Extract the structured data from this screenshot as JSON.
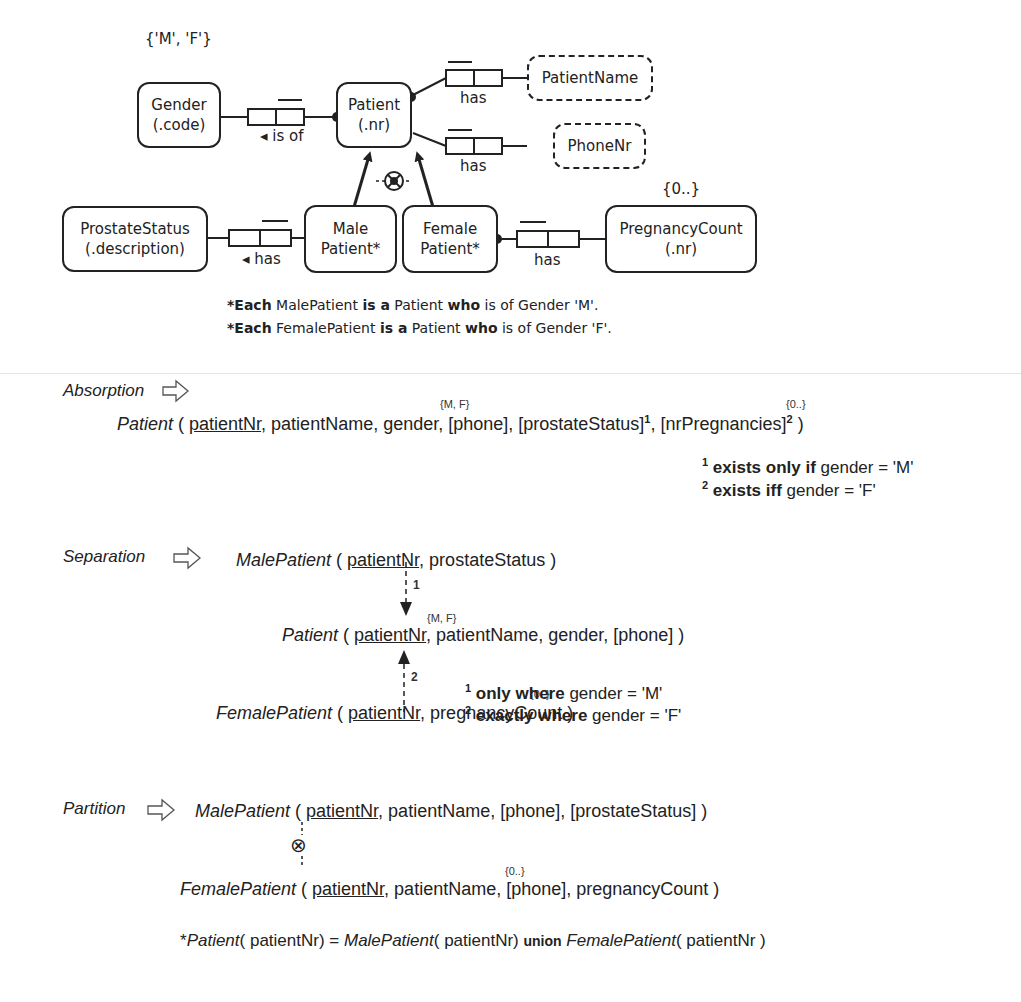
{
  "orm_diagram": {
    "entities": {
      "gender": {
        "name": "Gender",
        "ref": "(.code)",
        "value_constraint": "{'M', 'F'}"
      },
      "patient": {
        "name": "Patient",
        "ref": "(.nr)"
      },
      "patient_name": {
        "name": "PatientName"
      },
      "phone_nr": {
        "name": "PhoneNr"
      },
      "prostate_status": {
        "name": "ProstateStatus",
        "ref": "(.description)"
      },
      "male_patient": {
        "name": "Male",
        "name2": "Patient*"
      },
      "female_patient": {
        "name": "Female",
        "name2": "Patient*"
      },
      "pregnancy_count": {
        "name": "PregnancyCount",
        "ref": "(.nr)",
        "value_constraint": "{0..}"
      }
    },
    "fact_types": {
      "gender_patient": "◂ is of",
      "patient_name": "has",
      "patient_phone": "has",
      "male_prostate": "◂ has",
      "female_pregnancy": "has"
    },
    "subtype_definitions": [
      {
        "star": "*",
        "each": "Each",
        "subtype": " MalePatient ",
        "is_a": "is a",
        "super": " Patient ",
        "who": "who",
        "rest": " is of Gender 'M'."
      },
      {
        "star": "*",
        "each": "Each",
        "subtype": " FemalePatient ",
        "is_a": "is a",
        "super": " Patient ",
        "who": "who",
        "rest": " is of Gender 'F'."
      }
    ]
  },
  "absorption": {
    "label": "Absorption",
    "relation_name": "Patient",
    "open": " ( ",
    "key": "patientNr",
    "rest_a": ", patientName, gender, [phone], [prostateStatus]",
    "sup1": "1",
    "rest_b": ", [nrPregnancies]",
    "sup2": "2",
    "close": " )",
    "gender_constraint": "{M, F}",
    "count_constraint": "{0..}",
    "footnotes": [
      {
        "num": "1",
        "bold": " exists only if",
        "text": " gender = 'M'"
      },
      {
        "num": "2",
        "bold": " exists iff",
        "text": " gender = 'F'"
      }
    ]
  },
  "separation": {
    "label": "Separation",
    "male": {
      "name": "MalePatient",
      "open": " ( ",
      "key": "patientNr",
      "rest": ", prostateStatus )"
    },
    "patient": {
      "name": "Patient",
      "open": " ( ",
      "key": "patientNr",
      "rest": ", patientName, gender, [phone] )",
      "gender_constraint": "{M, F}"
    },
    "female": {
      "name": "FemalePatient",
      "open": " ( ",
      "key": "patientNr",
      "rest": ", pregnancyCount )",
      "count_constraint": "{0..}"
    },
    "arrow_labels": [
      "1",
      "2"
    ],
    "footnotes": [
      {
        "num": "1",
        "bold": " only where",
        "text": " gender = 'M'"
      },
      {
        "num": "2",
        "bold": " exactly where",
        "text": " gender = 'F'"
      }
    ]
  },
  "partition": {
    "label": "Partition",
    "male": {
      "name": "MalePatient",
      "open": " ( ",
      "key": "patientNr",
      "rest": ", patientName, [phone], [prostateStatus] )"
    },
    "female": {
      "name": "FemalePatient",
      "open": " ( ",
      "key": "patientNr",
      "rest": ", patientName, [phone], pregnancyCount )",
      "count_constraint": "{0..}"
    },
    "exclusion_symbol": "⊗",
    "union_rule": {
      "star": "*",
      "patient": "Patient",
      "arg1": "( patientNr) = ",
      "male": "MalePatient",
      "arg2": "( patientNr) ",
      "union": "union",
      "female": " FemalePatient",
      "arg3": "( patientNr )"
    }
  }
}
